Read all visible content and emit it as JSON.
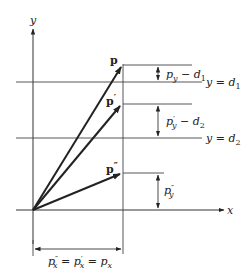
{
  "figure": {
    "axes": {
      "x_label": "x",
      "y_label": "y"
    },
    "vectors": [
      {
        "name": "p",
        "label": "p",
        "prime": ""
      },
      {
        "name": "p-prime",
        "label": "p",
        "prime": "′"
      },
      {
        "name": "p-double-prime",
        "label": "p",
        "prime": "″"
      }
    ],
    "lines": {
      "d1": {
        "lhs": "y = ",
        "var": "d",
        "sub": "1"
      },
      "d2": {
        "lhs": "y = ",
        "var": "d",
        "sub": "2"
      }
    },
    "dimensions": {
      "py_minus_d1": {
        "p": "p",
        "sub": "y",
        "prime": "",
        "minus": " − ",
        "d": "d",
        "dsub": "1"
      },
      "pyprime_minus_d2": {
        "p": "p",
        "sub": "y",
        "prime": "′",
        "minus": " − ",
        "d": "d",
        "dsub": "2"
      },
      "pydoubleprime": {
        "p": "p",
        "sub": "y",
        "prime": "″"
      },
      "px_equality": {
        "p1": "p",
        "s1": "x",
        "pr1": "″",
        "eq1": " = ",
        "p2": "p",
        "s2": "x",
        "pr2": "′",
        "eq2": " = ",
        "p3": "p",
        "s3": "x"
      }
    },
    "colors": {
      "stroke": "#333333",
      "thin": "#555555"
    }
  }
}
